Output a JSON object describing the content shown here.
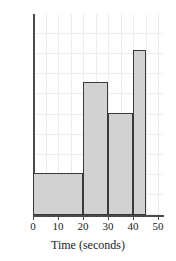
{
  "chart_data": {
    "type": "bar",
    "title": "",
    "subtitle": "",
    "xlabel": "Time (seconds)",
    "ylabel": "",
    "xlim": [
      0,
      52
    ],
    "ylim": [
      0,
      10
    ],
    "grid": true,
    "legend": false,
    "legend_position": "none",
    "xticks": [
      "0",
      "10",
      "20",
      "30",
      "40",
      "50"
    ],
    "xtick_values": [
      0,
      10,
      20,
      30,
      40,
      50
    ],
    "yticks": [],
    "bar_style": {
      "fill": "#d2d2d2",
      "edge": "#3a3a3a",
      "grid_color": "#ececec",
      "axis_color": "#4a4a4a"
    },
    "bins": [
      {
        "label": "0-20",
        "start": 0,
        "end": 20,
        "value": 2.1
      },
      {
        "label": "20-30",
        "start": 20,
        "end": 30,
        "value": 6.6
      },
      {
        "label": "30-40",
        "start": 30,
        "end": 40,
        "value": 5.1
      },
      {
        "label": "40-45",
        "start": 40,
        "end": 45,
        "value": 8.2
      }
    ],
    "categories": [
      "0-20",
      "20-30",
      "30-40",
      "40-45"
    ],
    "values": [
      2.1,
      6.6,
      5.1,
      8.2
    ]
  }
}
